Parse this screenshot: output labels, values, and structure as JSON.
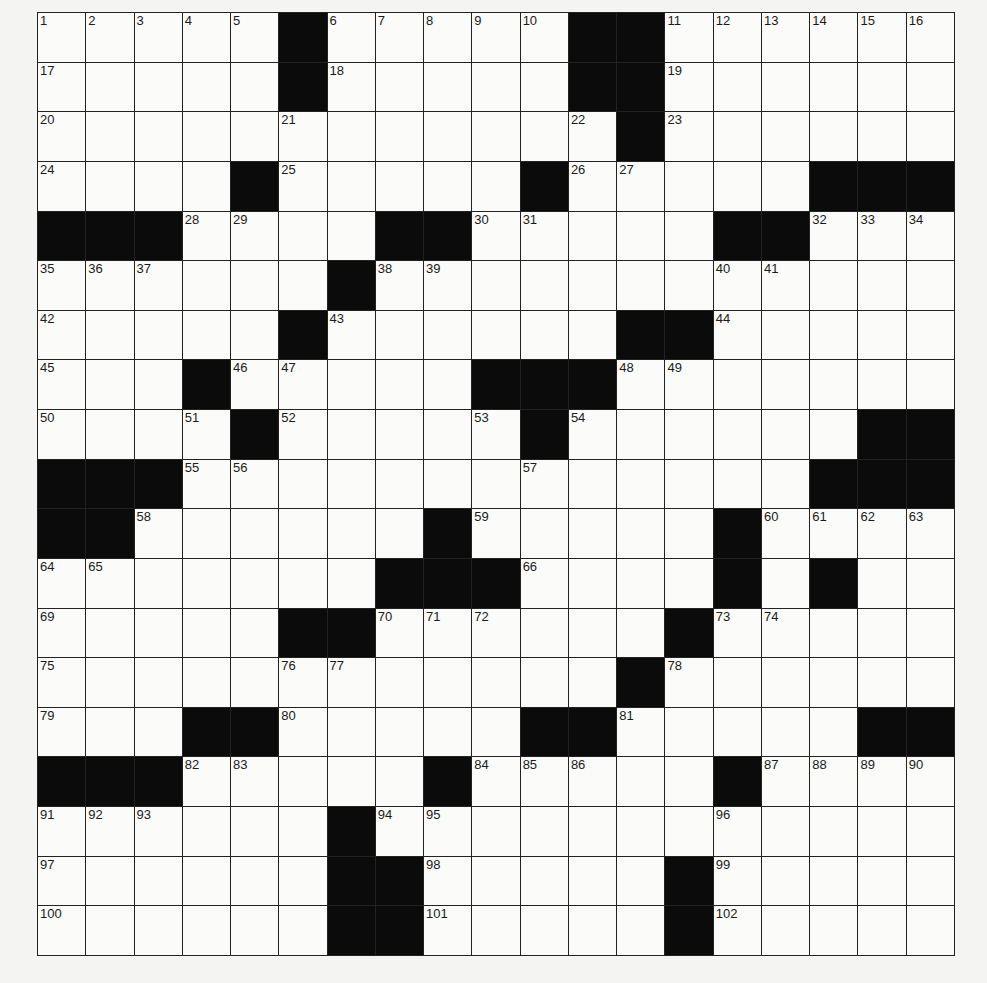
{
  "puzzle": {
    "rows": 19,
    "cols": 19,
    "colors": {
      "black_square": "#0b0b0b",
      "white_square": "#fbfbf9",
      "grid_line": "#222222",
      "background": "#f4f4f2"
    },
    "layout": [
      ".....#.....##......",
      ".....#.....##......",
      "............#......",
      "....#.....#.....###",
      "###....##.....##...",
      "......#............",
      ".....#......##.....",
      "...#.....###.......",
      "....#.....#......##",
      "###.............###",
      "##......#.....#....",
      ".......###....#.#..",
      ".....##......#.....",
      "............#......",
      "...##.....##.....###",
      "###.....#.....#....",
      "......#............",
      "......##.....#.....",
      "......##.....#....."
    ],
    "numbers": [
      {
        "r": 0,
        "c": 0,
        "n": 1
      },
      {
        "r": 0,
        "c": 1,
        "n": 2
      },
      {
        "r": 0,
        "c": 2,
        "n": 3
      },
      {
        "r": 0,
        "c": 3,
        "n": 4
      },
      {
        "r": 0,
        "c": 4,
        "n": 5
      },
      {
        "r": 0,
        "c": 6,
        "n": 6
      },
      {
        "r": 0,
        "c": 7,
        "n": 7
      },
      {
        "r": 0,
        "c": 8,
        "n": 8
      },
      {
        "r": 0,
        "c": 9,
        "n": 9
      },
      {
        "r": 0,
        "c": 10,
        "n": 10
      },
      {
        "r": 0,
        "c": 13,
        "n": 11
      },
      {
        "r": 0,
        "c": 14,
        "n": 12
      },
      {
        "r": 0,
        "c": 15,
        "n": 13
      },
      {
        "r": 0,
        "c": 16,
        "n": 14
      },
      {
        "r": 0,
        "c": 17,
        "n": 15
      },
      {
        "r": 0,
        "c": 18,
        "n": 16
      },
      {
        "r": 1,
        "c": 0,
        "n": 17
      },
      {
        "r": 1,
        "c": 6,
        "n": 18
      },
      {
        "r": 1,
        "c": 13,
        "n": 19
      },
      {
        "r": 2,
        "c": 0,
        "n": 20
      },
      {
        "r": 2,
        "c": 5,
        "n": 21
      },
      {
        "r": 2,
        "c": 11,
        "n": 22
      },
      {
        "r": 2,
        "c": 13,
        "n": 23
      },
      {
        "r": 3,
        "c": 0,
        "n": 24
      },
      {
        "r": 3,
        "c": 5,
        "n": 25
      },
      {
        "r": 3,
        "c": 11,
        "n": 26
      },
      {
        "r": 3,
        "c": 12,
        "n": 27
      },
      {
        "r": 4,
        "c": 3,
        "n": 28
      },
      {
        "r": 4,
        "c": 4,
        "n": 29
      },
      {
        "r": 4,
        "c": 9,
        "n": 30
      },
      {
        "r": 4,
        "c": 10,
        "n": 31
      },
      {
        "r": 4,
        "c": 16,
        "n": 32
      },
      {
        "r": 4,
        "c": 17,
        "n": 33
      },
      {
        "r": 4,
        "c": 18,
        "n": 34
      },
      {
        "r": 5,
        "c": 0,
        "n": 35
      },
      {
        "r": 5,
        "c": 1,
        "n": 36
      },
      {
        "r": 5,
        "c": 2,
        "n": 37
      },
      {
        "r": 5,
        "c": 7,
        "n": 38
      },
      {
        "r": 5,
        "c": 8,
        "n": 39
      },
      {
        "r": 5,
        "c": 14,
        "n": 40
      },
      {
        "r": 5,
        "c": 15,
        "n": 41
      },
      {
        "r": 6,
        "c": 0,
        "n": 42
      },
      {
        "r": 6,
        "c": 6,
        "n": 43
      },
      {
        "r": 6,
        "c": 14,
        "n": 44
      },
      {
        "r": 7,
        "c": 0,
        "n": 45
      },
      {
        "r": 7,
        "c": 4,
        "n": 46
      },
      {
        "r": 7,
        "c": 5,
        "n": 47
      },
      {
        "r": 7,
        "c": 12,
        "n": 48
      },
      {
        "r": 7,
        "c": 13,
        "n": 49
      },
      {
        "r": 8,
        "c": 0,
        "n": 50
      },
      {
        "r": 8,
        "c": 3,
        "n": 51
      },
      {
        "r": 8,
        "c": 5,
        "n": 52
      },
      {
        "r": 8,
        "c": 9,
        "n": 53
      },
      {
        "r": 8,
        "c": 11,
        "n": 54
      },
      {
        "r": 9,
        "c": 3,
        "n": 55
      },
      {
        "r": 9,
        "c": 4,
        "n": 56
      },
      {
        "r": 9,
        "c": 10,
        "n": 57
      },
      {
        "r": 10,
        "c": 2,
        "n": 58
      },
      {
        "r": 10,
        "c": 9,
        "n": 59
      },
      {
        "r": 10,
        "c": 15,
        "n": 60
      },
      {
        "r": 10,
        "c": 16,
        "n": 61
      },
      {
        "r": 10,
        "c": 17,
        "n": 62
      },
      {
        "r": 10,
        "c": 18,
        "n": 63
      },
      {
        "r": 11,
        "c": 0,
        "n": 64
      },
      {
        "r": 11,
        "c": 1,
        "n": 65
      },
      {
        "r": 11,
        "c": 10,
        "n": 66
      },
      {
        "r": 11,
        "c": 14,
        "n": 67
      },
      {
        "r": 11,
        "c": 16,
        "n": 68
      },
      {
        "r": 12,
        "c": 0,
        "n": 69
      },
      {
        "r": 12,
        "c": 7,
        "n": 70
      },
      {
        "r": 12,
        "c": 8,
        "n": 71
      },
      {
        "r": 12,
        "c": 9,
        "n": 72
      },
      {
        "r": 12,
        "c": 14,
        "n": 73
      },
      {
        "r": 12,
        "c": 15,
        "n": 74
      },
      {
        "r": 13,
        "c": 0,
        "n": 75
      },
      {
        "r": 13,
        "c": 5,
        "n": 76
      },
      {
        "r": 13,
        "c": 6,
        "n": 77
      },
      {
        "r": 13,
        "c": 13,
        "n": 78
      },
      {
        "r": 14,
        "c": 0,
        "n": 79
      },
      {
        "r": 14,
        "c": 5,
        "n": 80
      },
      {
        "r": 14,
        "c": 12,
        "n": 81
      },
      {
        "r": 15,
        "c": 3,
        "n": 82
      },
      {
        "r": 15,
        "c": 4,
        "n": 83
      },
      {
        "r": 15,
        "c": 9,
        "n": 84
      },
      {
        "r": 15,
        "c": 10,
        "n": 85
      },
      {
        "r": 15,
        "c": 11,
        "n": 86
      },
      {
        "r": 15,
        "c": 15,
        "n": 87
      },
      {
        "r": 15,
        "c": 16,
        "n": 88
      },
      {
        "r": 15,
        "c": 17,
        "n": 89
      },
      {
        "r": 15,
        "c": 18,
        "n": 90
      },
      {
        "r": 16,
        "c": 0,
        "n": 91
      },
      {
        "r": 16,
        "c": 1,
        "n": 92
      },
      {
        "r": 16,
        "c": 2,
        "n": 93
      },
      {
        "r": 16,
        "c": 7,
        "n": 94
      },
      {
        "r": 16,
        "c": 8,
        "n": 95
      },
      {
        "r": 16,
        "c": 14,
        "n": 96
      },
      {
        "r": 17,
        "c": 0,
        "n": 97
      },
      {
        "r": 17,
        "c": 8,
        "n": 98
      },
      {
        "r": 17,
        "c": 14,
        "n": 99
      },
      {
        "r": 18,
        "c": 0,
        "n": 100
      },
      {
        "r": 18,
        "c": 8,
        "n": 101
      },
      {
        "r": 18,
        "c": 14,
        "n": 102
      }
    ]
  }
}
